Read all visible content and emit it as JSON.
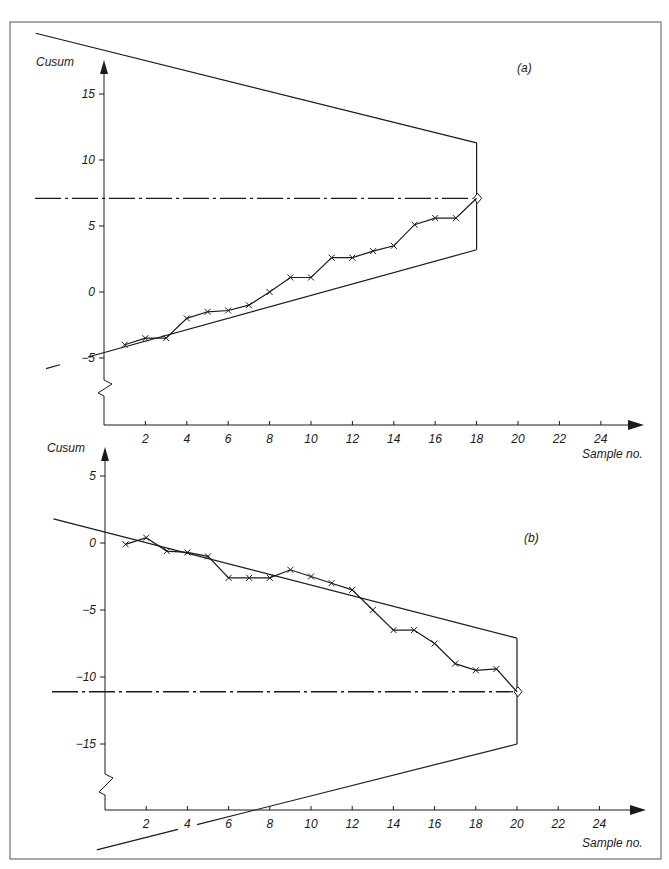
{
  "figure": {
    "border_color": "#555555",
    "ink_color": "#1a1a1a"
  },
  "chart_data": [
    {
      "type": "line",
      "panel_label": "(a)",
      "title": "",
      "xlabel": "Sample no.",
      "ylabel": "Cusum",
      "x_ticks": [
        2,
        4,
        6,
        8,
        10,
        12,
        14,
        16,
        18,
        20,
        22,
        24
      ],
      "y_ticks": [
        15,
        10,
        5,
        0,
        -5
      ],
      "y_tick_labels": [
        "15",
        "10",
        "5",
        "0",
        "−5"
      ],
      "x_tick_labels": [
        "2",
        "4",
        "6",
        "8",
        "10",
        "12",
        "14",
        "16",
        "18",
        "20",
        "22",
        "24"
      ],
      "xlim": [
        0,
        26
      ],
      "ylim": [
        -6,
        19
      ],
      "grid": false,
      "axis_break": "y-axis zigzag below -5",
      "series": [
        {
          "name": "Cusum",
          "marker": "x",
          "x": [
            1,
            2,
            3,
            4,
            5,
            6,
            7,
            8,
            9,
            10,
            11,
            12,
            13,
            14,
            15,
            16,
            17,
            18
          ],
          "values": [
            -4.0,
            -3.5,
            -3.5,
            -2.0,
            -1.5,
            -1.4,
            -1.0,
            0.0,
            1.1,
            1.1,
            2.6,
            2.6,
            3.1,
            3.5,
            5.1,
            5.6,
            5.6,
            7.1
          ]
        }
      ],
      "v_mask": {
        "vertex_x": 18,
        "vertex_y": 7.1,
        "upper_arm_top": 11.3,
        "lower_arm_bottom": 3.2,
        "upper_arm_start": {
          "x": -3.3,
          "y": 19.6
        },
        "lower_arm_start": {
          "x": -2.8,
          "y": -5.8
        }
      },
      "reference_line": {
        "style": "dash-dot",
        "y": 7.1
      }
    },
    {
      "type": "line",
      "panel_label": "(b)",
      "title": "",
      "xlabel": "Sample no.",
      "ylabel": "Cusum",
      "x_ticks": [
        2,
        4,
        6,
        8,
        10,
        12,
        14,
        16,
        18,
        20,
        22,
        24
      ],
      "y_ticks": [
        5,
        0,
        -5,
        -10,
        -15
      ],
      "y_tick_labels": [
        "5",
        "0",
        "−5",
        "−10",
        "−15"
      ],
      "x_tick_labels": [
        "2",
        "4",
        "6",
        "8",
        "10",
        "12",
        "14",
        "16",
        "18",
        "20",
        "22",
        "24"
      ],
      "xlim": [
        0,
        26
      ],
      "ylim": [
        -20,
        7
      ],
      "grid": false,
      "axis_break": "y-axis zigzag below -15",
      "series": [
        {
          "name": "Cusum",
          "marker": "x",
          "x": [
            1,
            2,
            3,
            4,
            5,
            6,
            7,
            8,
            9,
            10,
            11,
            12,
            13,
            14,
            15,
            16,
            17,
            18,
            19,
            20
          ],
          "values": [
            -0.1,
            0.4,
            -0.6,
            -0.7,
            -1.0,
            -2.6,
            -2.6,
            -2.6,
            -2.0,
            -2.5,
            -3.0,
            -3.5,
            -5.0,
            -6.5,
            -6.5,
            -7.5,
            -9.0,
            -9.5,
            -9.4,
            -11.1
          ]
        }
      ],
      "v_mask": {
        "vertex_x": 20,
        "vertex_y": -11.1,
        "upper_arm_top": -7.1,
        "lower_arm_bottom": -15.0,
        "upper_arm_start": {
          "x": -2.5,
          "y": 1.8
        },
        "lower_arm_start": {
          "x": -0.4,
          "y": -22.9
        }
      },
      "reference_line": {
        "style": "dash-dot",
        "y": -11.1
      }
    }
  ],
  "labels": {
    "a": {
      "panel": "(a)",
      "ylabel": "Cusum",
      "xlabel": "Sample no."
    },
    "b": {
      "panel": "(b)",
      "ylabel": "Cusum",
      "xlabel": "Sample no."
    }
  }
}
